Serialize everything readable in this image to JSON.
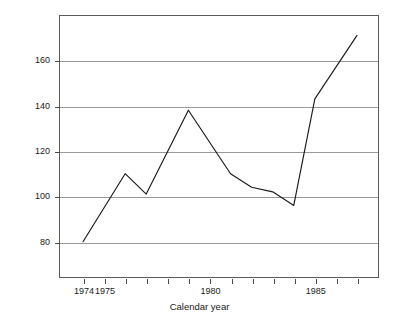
{
  "chart_data": {
    "type": "line",
    "title": "",
    "xlabel": "Calendar year",
    "ylabel": "Market share index, 1974 = 100",
    "x": [
      1974,
      1975,
      1976,
      1977,
      1979,
      1981,
      1982,
      1983,
      1984,
      1985,
      1987
    ],
    "values": [
      80,
      95,
      110,
      101,
      138,
      110,
      104,
      102,
      96,
      143,
      171
    ],
    "series": [
      {
        "name": "Market share index",
        "values": [
          80,
          95,
          110,
          101,
          138,
          110,
          104,
          102,
          96,
          143,
          171
        ]
      }
    ],
    "xlim": [
      1974,
      1987
    ],
    "ylim": [
      64,
      180
    ],
    "grid": true,
    "grid_axis": "y",
    "legend": "none",
    "line_color": "#1a1a1a",
    "frame_color": "#5a5a5a",
    "gridline_color": "#9a9a9a",
    "background": "#ffffff",
    "y_ticks": [
      {
        "value": 80,
        "label": "80"
      },
      {
        "value": 100,
        "label": "100"
      },
      {
        "value": 120,
        "label": "120"
      },
      {
        "value": 140,
        "label": "140"
      },
      {
        "value": 160,
        "label": "160"
      }
    ],
    "x_ticks": [
      {
        "value": 1974,
        "label": "1974"
      },
      {
        "value": 1975,
        "label": "1975"
      },
      {
        "value": 1976,
        "label": ""
      },
      {
        "value": 1977,
        "label": ""
      },
      {
        "value": 1978,
        "label": ""
      },
      {
        "value": 1979,
        "label": ""
      },
      {
        "value": 1980,
        "label": "1980"
      },
      {
        "value": 1981,
        "label": ""
      },
      {
        "value": 1982,
        "label": ""
      },
      {
        "value": 1983,
        "label": ""
      },
      {
        "value": 1984,
        "label": ""
      },
      {
        "value": 1985,
        "label": "1985"
      },
      {
        "value": 1986,
        "label": ""
      },
      {
        "value": 1987,
        "label": ""
      }
    ]
  }
}
